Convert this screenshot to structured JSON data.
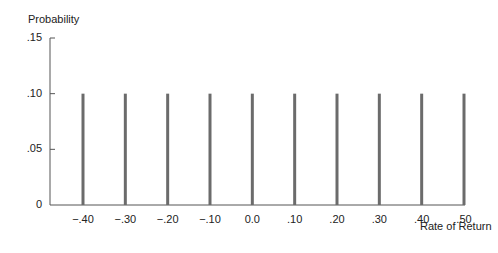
{
  "chart_data": {
    "type": "bar",
    "title": "",
    "xlabel": "Rate of Return",
    "ylabel": "Probability",
    "categories": [
      "−.40",
      "−.30",
      "−.20",
      "−.10",
      "0.0",
      ".10",
      ".20",
      ".30",
      ".40",
      ".50"
    ],
    "x": [
      -0.4,
      -0.3,
      -0.2,
      -0.1,
      0.0,
      0.1,
      0.2,
      0.3,
      0.4,
      0.5
    ],
    "values": [
      0.1,
      0.1,
      0.1,
      0.1,
      0.1,
      0.1,
      0.1,
      0.1,
      0.1,
      0.1
    ],
    "yticks": [
      {
        "value": 0,
        "label": "0"
      },
      {
        "value": 0.05,
        "label": ".05"
      },
      {
        "value": 0.1,
        "label": ".10"
      },
      {
        "value": 0.15,
        "label": ".15"
      }
    ],
    "ylim": [
      0,
      0.15
    ],
    "xlim": [
      -0.5,
      0.5
    ],
    "grid": false,
    "legend": null,
    "bar_color": "#6b6b6b",
    "axis_color": "#555555"
  }
}
